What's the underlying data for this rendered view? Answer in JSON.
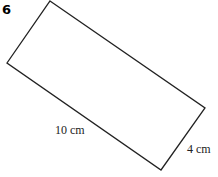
{
  "question_number": "6",
  "shape": "rectangle",
  "labels": {
    "length": "10 cm",
    "width": "4 cm"
  },
  "colors": {
    "stroke": "#222222",
    "background": "#ffffff"
  }
}
